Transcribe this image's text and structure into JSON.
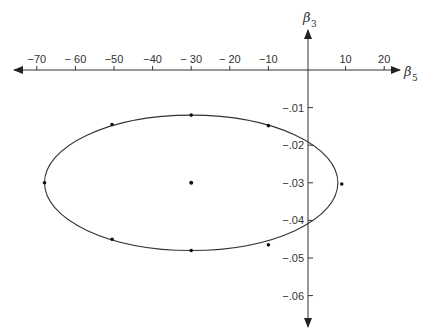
{
  "chart_data": {
    "type": "scatter",
    "title": "",
    "xlabel": "β5",
    "ylabel": "β3",
    "x_ticks": [
      -70,
      -60,
      -50,
      -40,
      -30,
      -20,
      -10,
      10,
      20
    ],
    "x_tick_labels": [
      "−70",
      "− 60",
      "−50",
      "−40",
      "− 30",
      "− 20",
      "−10",
      "10",
      "20"
    ],
    "y_ticks": [
      -0.01,
      -0.02,
      -0.03,
      -0.04,
      -0.05,
      -0.06
    ],
    "y_tick_labels": [
      "−.01",
      "−.02",
      "−.03",
      "−.04",
      "−.05",
      "−.06"
    ],
    "xlim": [
      -73,
      25
    ],
    "ylim": [
      -0.068,
      0.01
    ],
    "grid": false,
    "legend": null,
    "ellipse": {
      "center": [
        -30,
        -0.03
      ],
      "semi_axis_x": 38,
      "semi_axis_y": 0.018
    },
    "center_point": {
      "x": -30,
      "y": -0.03
    },
    "points_on_ellipse": [
      {
        "x": -68,
        "y": -0.03
      },
      {
        "x": -50.5,
        "y": -0.0145
      },
      {
        "x": -30,
        "y": -0.012
      },
      {
        "x": -10,
        "y": -0.0148
      },
      {
        "x": 9,
        "y": -0.0303
      },
      {
        "x": -10,
        "y": -0.0465
      },
      {
        "x": -30,
        "y": -0.048
      },
      {
        "x": -50.5,
        "y": -0.045
      }
    ]
  },
  "labels": {
    "x_axis_name": "β",
    "x_axis_sub": "5",
    "y_axis_name": "β",
    "y_axis_sub": "3"
  }
}
